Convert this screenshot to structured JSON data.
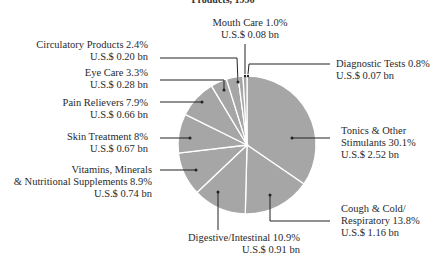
{
  "chart_data": {
    "type": "pie",
    "title": "Products, 1996",
    "start_angle": "12 o'clock",
    "direction": "clockwise",
    "currency_prefix": "U.S.$",
    "fill_color": "#a6a6a6",
    "separator_color": "#ffffff",
    "slices": [
      {
        "label": "Tonics & Other Stimulants",
        "percent": 30.1,
        "value_bn": 2.52,
        "pct_text": "30.1%",
        "value_text": "U.S.$ 2.52 bn"
      },
      {
        "label": "Cough & Cold/ Respiratory",
        "percent": 13.8,
        "value_bn": 1.16,
        "pct_text": "13.8%",
        "value_text": "U.S.$ 1.16 bn"
      },
      {
        "label": "Digestive/Intestinal",
        "percent": 10.9,
        "value_bn": 0.91,
        "pct_text": "10.9%",
        "value_text": "U.S.$ 0.91 bn"
      },
      {
        "label": "Vitamins, Minerals & Nutritional Supplements",
        "percent": 8.9,
        "value_bn": 0.74,
        "pct_text": "8.9%",
        "value_text": "U.S.$ 0.74 bn"
      },
      {
        "label": "Skin Treatment",
        "percent": 8,
        "value_bn": 0.67,
        "pct_text": "8%",
        "value_text": "U.S.$ 0.67 bn"
      },
      {
        "label": "Pain Relievers",
        "percent": 7.9,
        "value_bn": 0.66,
        "pct_text": "7.9%",
        "value_text": "U.S.$ 0.66 bn"
      },
      {
        "label": "Eye Care",
        "percent": 3.3,
        "value_bn": 0.28,
        "pct_text": "3.3%",
        "value_text": "U.S.$ 0.28 bn"
      },
      {
        "label": "Circulatory Products",
        "percent": 2.4,
        "value_bn": 0.2,
        "pct_text": "2.4%",
        "value_text": "U.S.$ 0.20 bn"
      },
      {
        "label": "Mouth Care",
        "percent": 1.0,
        "value_bn": 0.08,
        "pct_text": "1.0%",
        "value_text": "U.S.$ 0.08 bn"
      },
      {
        "label": "Diagnostic Tests",
        "percent": 0.8,
        "value_bn": 0.07,
        "pct_text": "0.8%",
        "value_text": "U.S.$ 0.07 bn"
      }
    ]
  },
  "labels": {
    "tonics": {
      "line1": "Tonics & Other",
      "line2": "Stimulants  30.1%",
      "line3": "U.S.$ 2.52 bn"
    },
    "cough": {
      "line1": "Cough & Cold/",
      "line2": "Respiratory  13.8%",
      "line3": "U.S.$ 1.16 bn"
    },
    "digestive": {
      "line1": "Digestive/Intestinal  10.9%",
      "line2": "U.S.$ 0.91 bn"
    },
    "vitamins": {
      "line1": "Vitamins, Minerals",
      "line2": "& Nutritional Supplements 8.9%",
      "line3": "U.S.$ 0.74 bn"
    },
    "skin": {
      "line1": "Skin Treatment  8%",
      "line2": "U.S.$ 0.67 bn"
    },
    "pain": {
      "line1": "Pain Relievers  7.9%",
      "line2": "U.S.$ 0.66 bn"
    },
    "eye": {
      "line1": "Eye Care  3.3%",
      "line2": "U.S.$ 0.28 bn"
    },
    "circulatory": {
      "line1": "Circulatory Products  2.4%",
      "line2": "U.S.$ 0.20 bn"
    },
    "mouth": {
      "line1": "Mouth Care  1.0%",
      "line2": "U.S.$ 0.08 bn"
    },
    "diagnostic": {
      "line1": "Diagnostic Tests  0.8%",
      "line2": "U.S.$ 0.07 bn"
    }
  }
}
